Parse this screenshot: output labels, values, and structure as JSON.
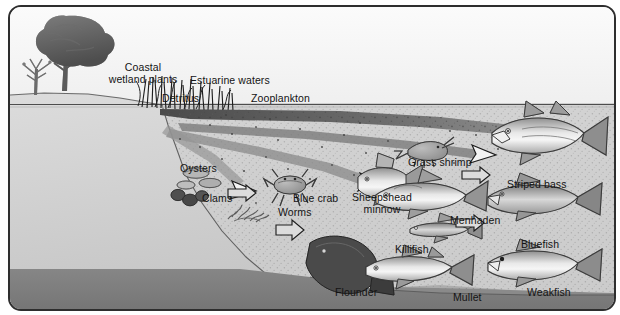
{
  "figure": {
    "kind": "estuarine-food-web-illustration",
    "background_sky": "#f2f2f2",
    "land_color": "#d0d0d0",
    "shallow_water_color": "#c8c8c8",
    "deep_water_color": "#8d8d8d",
    "seafloor_color": "#7e7e7e",
    "outline_color": "#2e2e2e",
    "label_color": "#141414"
  },
  "labels": {
    "coastal_wetland_plants": "Coastal\nwetland plants",
    "estuarine_waters": "Estuarine waters",
    "detritus": "Detritus",
    "zooplankton": "Zooplankton",
    "oysters": "Oysters",
    "clams": "Clams",
    "worms": "Worms",
    "blue_crab": "Blue crab",
    "grass_shrimp": "Grass shrimp",
    "sheepshead_minnow": "Sheepshead\nminnow",
    "killifish": "Killifish",
    "flounder": "Flounder",
    "menhaden": "Menhaden",
    "mullet": "Mullet",
    "striped_bass": "Striped bass",
    "bluefish": "Bluefish",
    "weakfish": "Weakfish"
  },
  "organisms": [
    {
      "name": "Coastal wetland plants",
      "label": "Coastal\nwetland plants",
      "group": "producer"
    },
    {
      "name": "Detritus",
      "label": "Detritus",
      "group": "organic-matter"
    },
    {
      "name": "Zooplankton",
      "label": "Zooplankton",
      "group": "plankton"
    },
    {
      "name": "Oysters",
      "label": "Oysters",
      "group": "filter-feeder"
    },
    {
      "name": "Clams",
      "label": "Clams",
      "group": "filter-feeder"
    },
    {
      "name": "Worms",
      "label": "Worms",
      "group": "detritivore"
    },
    {
      "name": "Blue crab",
      "label": "Blue crab",
      "group": "crustacean"
    },
    {
      "name": "Grass shrimp",
      "label": "Grass shrimp",
      "group": "crustacean"
    },
    {
      "name": "Sheepshead minnow",
      "label": "Sheepshead\nminnow",
      "group": "forage-fish"
    },
    {
      "name": "Killifish",
      "label": "Killifish",
      "group": "forage-fish"
    },
    {
      "name": "Flounder",
      "label": "Flounder",
      "group": "flatfish"
    },
    {
      "name": "Menhaden",
      "label": "Menhaden",
      "group": "forage-fish"
    },
    {
      "name": "Mullet",
      "label": "Mullet",
      "group": "forage-fish"
    },
    {
      "name": "Striped bass",
      "label": "Striped bass",
      "group": "predator-fish"
    },
    {
      "name": "Bluefish",
      "label": "Bluefish",
      "group": "predator-fish"
    },
    {
      "name": "Weakfish",
      "label": "Weakfish",
      "group": "predator-fish"
    }
  ],
  "scene": {
    "estuarine_waters_zone": "Estuarine waters",
    "water_surface_label": "waterline",
    "flow_arrows_count": 6
  }
}
